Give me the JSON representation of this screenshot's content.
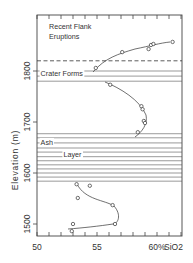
{
  "chart_data": {
    "type": "scatter",
    "title": "",
    "xlabel": "% SiO2",
    "ylabel": "Elevation (m)",
    "xlim": [
      50,
      62
    ],
    "ylim": [
      1475,
      1910
    ],
    "x_ticks": [
      50,
      55,
      60
    ],
    "x_tick_labels": [
      "50",
      "55",
      "60%"
    ],
    "x_unit_label": "SiO2",
    "y_ticks": [
      1500,
      1600,
      1700,
      1800
    ],
    "y_tick_labels": [
      "1500",
      "1600",
      "1700",
      "1800"
    ],
    "grid": false,
    "legend": null,
    "series": [
      {
        "name": "Recent Flank Eruptions",
        "points": [
          {
            "x": 54.9,
            "y": 1806
          },
          {
            "x": 57.1,
            "y": 1837
          },
          {
            "x": 59.3,
            "y": 1843
          },
          {
            "x": 59.5,
            "y": 1851
          },
          {
            "x": 59.7,
            "y": 1853
          },
          {
            "x": 61.3,
            "y": 1857
          }
        ]
      },
      {
        "name": "Crater Forms to Ash Layer section",
        "points": [
          {
            "x": 56.1,
            "y": 1773
          },
          {
            "x": 58.7,
            "y": 1731
          },
          {
            "x": 58.8,
            "y": 1725
          },
          {
            "x": 58.9,
            "y": 1702
          },
          {
            "x": 59.0,
            "y": 1698
          },
          {
            "x": 58.4,
            "y": 1680
          }
        ]
      },
      {
        "name": "Below Ash Layer",
        "points": [
          {
            "x": 53.3,
            "y": 1578
          },
          {
            "x": 54.4,
            "y": 1575
          },
          {
            "x": 53.4,
            "y": 1551
          },
          {
            "x": 56.3,
            "y": 1537
          },
          {
            "x": 56.5,
            "y": 1500
          },
          {
            "x": 53.0,
            "y": 1500
          },
          {
            "x": 52.9,
            "y": 1486
          }
        ]
      }
    ],
    "annotations": [
      {
        "text": "Recent Flank",
        "x": 51,
        "y": 1883
      },
      {
        "text": "Eruptions",
        "x": 51,
        "y": 1863
      },
      {
        "text": "Crater Forms",
        "x": 50.3,
        "y": 1790
      },
      {
        "text": "Ash",
        "x": 50.3,
        "y": 1655
      },
      {
        "text": "Layer",
        "x": 52.2,
        "y": 1632
      }
    ],
    "reference_lines": {
      "dashed": [
        1820
      ],
      "crater_forms": [
        1800,
        1790,
        1780
      ],
      "ash_layer": [
        1677,
        1669,
        1659,
        1649,
        1641,
        1632,
        1624,
        1616,
        1608,
        1600,
        1592,
        1584
      ]
    }
  }
}
